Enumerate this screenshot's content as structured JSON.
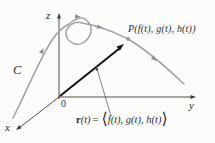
{
  "figure": {
    "axis_labels": {
      "x": "x",
      "y": "y",
      "z": "z"
    },
    "origin_label": "0",
    "curve_label": "C",
    "point_label": "P(f(t), g(t), h(t))",
    "formula": {
      "vector_symbol": "r",
      "argument": "(t)",
      "equals_sign": "=",
      "left_angle_bracket": "⟨",
      "components": "f(t), g(t), h(t)",
      "right_angle_bracket": "⟩"
    },
    "colors": {
      "background": "#fcfcfb",
      "curve": "#a2a2a6",
      "curve_arrow": "#8e8e93",
      "axis": "#3d3d3d",
      "vector": "#141414",
      "text": "#2e2e2e"
    }
  }
}
